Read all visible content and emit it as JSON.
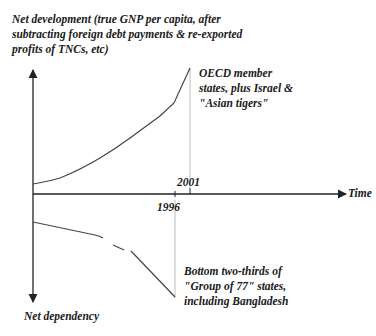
{
  "diagram": {
    "y_axis_top_label": "Net development (true GNP per capita, after\nsubtracting foreign debt payments & re-exported\nprofits of TNCs, etc)",
    "y_axis_bottom_label": "Net dependency",
    "x_axis_label": "Time",
    "tick_labels": {
      "t1996": "1996",
      "t2001": "2001"
    },
    "upper_curve_label": "OECD member\nstates, plus Israel &\n\"Asian tigers\"",
    "lower_curve_label": "Bottom two-thirds of\n\"Group of 77\" states,\nincluding Bangladesh",
    "colors": {
      "axis": "#222222",
      "curve": "#444444",
      "guide": "#bbbbbb",
      "text": "#1a1a1a"
    }
  }
}
